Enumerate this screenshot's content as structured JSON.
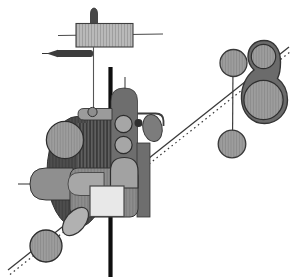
{
  "artwork": {
    "title": "abstract-grayscale-composition",
    "canvas": {
      "width": 292,
      "height": 279,
      "background": "#ffffff"
    },
    "palette": {
      "background": "#ffffff",
      "ink": "#0f0f0f",
      "dark_gray": "#4e4e4e",
      "mid_gray": "#8d8d8d",
      "light_gray": "#e8e8e8"
    },
    "patterns": [
      {
        "id": "lightHatch",
        "bg": "#b9b9b9",
        "stripe": "#9e9e9e",
        "size": 3,
        "stripeWidth": 1
      },
      {
        "id": "darkHatch",
        "bg": "#5f5f5f",
        "stripe": "#333333",
        "size": 3.4,
        "stripeWidth": 1.4
      },
      {
        "id": "medHatch",
        "bg": "#9e9e9e",
        "stripe": "#8b8b8b",
        "size": 2.8,
        "stripeWidth": 1
      },
      {
        "id": "darkStripe",
        "bg": "#4e4e4e",
        "stripe": "#3f3f3f",
        "size": 3.2,
        "stripeWidth": 1.2
      },
      {
        "id": "bodyStripe",
        "bg": "#8d8d8d",
        "stripe": "#7d7d7d",
        "size": 3.2,
        "stripeWidth": 1.2
      }
    ],
    "shapes": [
      {
        "type": "line",
        "name": "diagonal-line-solid",
        "x1": 8,
        "y1": 270,
        "x2": 289,
        "y2": 47,
        "stroke": "#3a3a3a",
        "strokeWidth": 1.3
      },
      {
        "type": "line",
        "name": "diagonal-line-dotted",
        "x1": 10,
        "y1": 274.5,
        "x2": 290,
        "y2": 52,
        "stroke": "#3a3a3a",
        "strokeWidth": 1.2,
        "dash": "1.6 3.2"
      },
      {
        "type": "line",
        "name": "top-horizontal-line",
        "x1": 58,
        "y1": 35.5,
        "x2": 163,
        "y2": 34,
        "stroke": "#4a4a4a",
        "strokeWidth": 1.1
      },
      {
        "type": "path",
        "name": "bullet-knob",
        "d": "M90.5,23.5 L90.5,14 Q90.5,8.5 94,8 Q97.5,8.5 97.5,14 L97.5,23.5 Z",
        "fill": "#484848",
        "stroke": "#2e2e2e",
        "strokeWidth": 0.8
      },
      {
        "type": "rect",
        "name": "hatched-panel",
        "x": 76,
        "y": 23.5,
        "width": 57,
        "height": 23.5,
        "fill": "url(#lightHatch)",
        "stroke": "#3e3e3e",
        "strokeWidth": 1.1
      },
      {
        "type": "line",
        "name": "pencil-tip-line",
        "x1": 42,
        "y1": 53.5,
        "x2": 57,
        "y2": 53.5,
        "stroke": "#333333",
        "strokeWidth": 1
      },
      {
        "type": "polygon",
        "name": "pencil-tip",
        "points": "46.5,53.5 58,49.8 58,57.2",
        "fill": "#3c3c3c"
      },
      {
        "type": "rect",
        "name": "pencil-body",
        "x": 56,
        "y": 50,
        "width": 37,
        "height": 7,
        "rx": 2.5,
        "fill": "#3c3c3c"
      },
      {
        "type": "line",
        "name": "pendant-line",
        "x1": 93.5,
        "y1": 47,
        "x2": 93.5,
        "y2": 109,
        "stroke": "#555555",
        "strokeWidth": 1.1
      },
      {
        "type": "line",
        "name": "thick-vertical-line",
        "x1": 110.5,
        "y1": 67,
        "x2": 110.5,
        "y2": 277,
        "stroke": "#0f0f0f",
        "strokeWidth": 4.2
      },
      {
        "type": "line",
        "name": "right-connector-line",
        "x1": 233,
        "y1": 64,
        "x2": 232.5,
        "y2": 144,
        "stroke": "#3f3f3f",
        "strokeWidth": 1.2
      },
      {
        "type": "circle",
        "name": "right-upper-circle",
        "cx": 233.5,
        "cy": 63,
        "r": 13.5,
        "fill": "url(#medHatch)",
        "stroke": "#383838",
        "strokeWidth": 1.3
      },
      {
        "type": "circle",
        "name": "right-lower-circle",
        "cx": 232,
        "cy": 144,
        "r": 13.8,
        "fill": "url(#medHatch)",
        "stroke": "#383838",
        "strokeWidth": 1.3
      },
      {
        "type": "path",
        "name": "pear-blob",
        "d": "M264,40.5 C254.5,40.5 248,47 248,56.5 C248,62 250.5,66.5 254,70 C246,76 241,87 241.5,99 C242,113.5 252,123.5 264.5,123.5 C277.5,123.5 287.5,113 287.5,100 C287.5,91 283.5,83 277.5,78.5 C279.5,74.5 280.5,69 280.5,62 C280.5,48.5 273.5,40.5 264,40.5 Z",
        "fill": "#6b6b6b",
        "stroke": "#343434",
        "strokeWidth": 1.4
      },
      {
        "type": "circle",
        "name": "blob-upper-circle",
        "cx": 263.5,
        "cy": 56.5,
        "r": 12.2,
        "fill": "url(#medHatch)",
        "stroke": "#2f2f2f",
        "strokeWidth": 1.2
      },
      {
        "type": "circle",
        "name": "blob-lower-circle",
        "cx": 263.5,
        "cy": 100,
        "r": 19.6,
        "fill": "url(#medHatch)",
        "stroke": "#2f2f2f",
        "strokeWidth": 1.3
      },
      {
        "type": "ellipse",
        "name": "large-dark-ellipse",
        "cx": 77,
        "cy": 172,
        "rx": 30,
        "ry": 55.5,
        "fill": "url(#darkStripe)",
        "stroke": "#333333",
        "strokeWidth": 1
      },
      {
        "type": "path",
        "name": "dark-hatched-block",
        "d": "M88,115 L113,115 L113,183 L77,183 L77,123 L88,123 Z",
        "fill": "url(#darkHatch)"
      },
      {
        "type": "path",
        "name": "tower-shape",
        "d": "M111,175 L111,101 Q111,88 124.2,88 Q137.5,88 137.5,101 L137.5,175 Z",
        "fill": "#6e6e6e",
        "stroke": "#3a3a3a",
        "strokeWidth": 0.8
      },
      {
        "type": "line",
        "name": "antenna-line",
        "x1": 125,
        "y1": 77,
        "x2": 125,
        "y2": 89,
        "stroke": "#444444",
        "strokeWidth": 1.1
      },
      {
        "type": "path",
        "name": "side-knob-bar",
        "d": "M112,108.5 L84,108.5 Q78,108.5 78,114.2 Q78,120 84,120 L112,120 Z",
        "fill": "#9b9b9b",
        "stroke": "#333333",
        "strokeWidth": 0.9
      },
      {
        "type": "circle",
        "name": "pendant-dot",
        "cx": 92.5,
        "cy": 112,
        "r": 4.6,
        "fill": "#8e8e8e",
        "stroke": "#2f2f2f",
        "strokeWidth": 1
      },
      {
        "type": "circle",
        "name": "tower-circle-1",
        "cx": 123.5,
        "cy": 124,
        "r": 8.6,
        "fill": "#a6a6a6",
        "stroke": "#2d2d2d",
        "strokeWidth": 1.2
      },
      {
        "type": "circle",
        "name": "tower-circle-2",
        "cx": 123.5,
        "cy": 145,
        "r": 8.6,
        "fill": "#a6a6a6",
        "stroke": "#2d2d2d",
        "strokeWidth": 1.2
      },
      {
        "type": "path",
        "name": "hook-line",
        "d": "M137.5,113.5 L155.5,113.5 Q163.5,113.5 163.5,121 L163.5,126",
        "fill": "none",
        "stroke": "#3d3d3d",
        "strokeWidth": 1.8
      },
      {
        "type": "circle",
        "name": "small-dark-dot",
        "cx": 138.5,
        "cy": 123,
        "r": 4,
        "fill": "#2e2e2e"
      },
      {
        "type": "ellipse",
        "name": "egg-ellipse",
        "cx": 152.5,
        "cy": 128,
        "rx": 9.6,
        "ry": 13.6,
        "transform": "rotate(-12 152.5 128)",
        "fill": "#7c7c7c",
        "stroke": "#383838",
        "strokeWidth": 1
      },
      {
        "type": "circle",
        "name": "left-circle",
        "cx": 65,
        "cy": 140,
        "r": 18.6,
        "fill": "url(#medHatch)",
        "stroke": "#2d2d2d",
        "strokeWidth": 1.3
      },
      {
        "type": "line",
        "name": "capsule-west-line",
        "x1": 18,
        "y1": 184,
        "x2": 31,
        "y2": 184,
        "stroke": "#444444",
        "strokeWidth": 1.1
      },
      {
        "type": "path",
        "name": "left-capsule",
        "d": "M73,168 L46,168 Q30,168 30,184 Q30,200 46,200 L73,200 Z",
        "fill": "#8f8f8f",
        "stroke": "#333333",
        "strokeWidth": 1
      },
      {
        "type": "rect",
        "name": "right-dark-bar",
        "x": 137,
        "y": 143,
        "width": 13,
        "height": 74,
        "fill": "#6e6e6e",
        "stroke": "#343434",
        "strokeWidth": 0.8
      },
      {
        "type": "rect",
        "name": "lower-body",
        "x": 70,
        "y": 168,
        "width": 68,
        "height": 49,
        "rx": 8,
        "fill": "url(#bodyStripe)",
        "stroke": "#333333",
        "strokeWidth": 1
      },
      {
        "type": "path",
        "name": "light-capsule",
        "d": "M104,172.5 L80,172.5 Q68,172.5 68,184 Q68,195.5 80,195.5 L104,195.5 Z",
        "fill": "#a7a7a7",
        "stroke": "#3a3a3a",
        "strokeWidth": 0.8
      },
      {
        "type": "path",
        "name": "arch-shape",
        "d": "M110.5,188 L110.5,171 Q110.5,157.5 124.2,157.5 Q138,157.5 138,171 L138,188 Z",
        "fill": "#a2a2a2",
        "stroke": "#2f2f2f",
        "strokeWidth": 1.2
      },
      {
        "type": "ellipse",
        "name": "bottom-tilted-ellipse",
        "cx": 75.5,
        "cy": 221.5,
        "rx": 16.5,
        "ry": 9.8,
        "transform": "rotate(-50 75.5 221.5)",
        "fill": "#b1b1b1",
        "stroke": "#333333",
        "strokeWidth": 1.2
      },
      {
        "type": "circle",
        "name": "bottom-left-circle",
        "cx": 46,
        "cy": 246,
        "r": 16,
        "fill": "url(#medHatch)",
        "stroke": "#2d2d2d",
        "strokeWidth": 1.3
      },
      {
        "type": "rect",
        "name": "light-square",
        "x": 90,
        "y": 186,
        "width": 34,
        "height": 30.5,
        "fill": "#e8e8e8",
        "stroke": "#474747",
        "strokeWidth": 1.2
      }
    ]
  }
}
